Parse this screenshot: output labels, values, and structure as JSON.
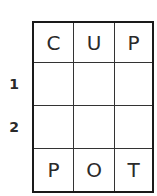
{
  "puzzle": {
    "type": "word-ladder",
    "start_word": "CUP",
    "end_word": "POT",
    "rows": [
      {
        "label": "",
        "letters": [
          "C",
          "U",
          "P"
        ]
      },
      {
        "label": "1",
        "letters": [
          "",
          "",
          ""
        ]
      },
      {
        "label": "2",
        "letters": [
          "",
          "",
          ""
        ]
      },
      {
        "label": "",
        "letters": [
          "P",
          "O",
          "T"
        ]
      }
    ]
  }
}
